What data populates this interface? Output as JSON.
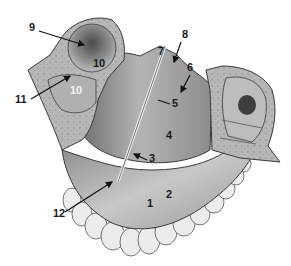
{
  "figure": {
    "colors": {
      "bone_light": "#d9d9d9",
      "bone_mid": "#a8a8a8",
      "bone_dark": "#6e6e6e",
      "cancellous": "#b9b9b9",
      "outline": "#3a3a3a",
      "teeth": "#ececec",
      "label": "#1a1a1a"
    }
  },
  "labels": [
    {
      "id": "1",
      "text": "1",
      "x": 151,
      "y": 203
    },
    {
      "id": "2",
      "text": "2",
      "x": 170,
      "y": 194
    },
    {
      "id": "3",
      "text": "3",
      "x": 148,
      "y": 157
    },
    {
      "id": "4",
      "text": "4",
      "x": 165,
      "y": 134
    },
    {
      "id": "5",
      "text": "5",
      "x": 172,
      "y": 103
    },
    {
      "id": "6",
      "text": "6",
      "x": 188,
      "y": 66
    },
    {
      "id": "7",
      "text": "7",
      "x": 158,
      "y": 49
    },
    {
      "id": "8",
      "text": "8",
      "x": 182,
      "y": 33
    },
    {
      "id": "9",
      "text": "9",
      "x": 29,
      "y": 26
    },
    {
      "id": "10a",
      "text": "10",
      "x": 94,
      "y": 61,
      "color": "dark"
    },
    {
      "id": "10b",
      "text": "10",
      "x": 71,
      "y": 88,
      "color": "white"
    },
    {
      "id": "11",
      "text": "11",
      "x": 16,
      "y": 98
    },
    {
      "id": "12",
      "text": "12",
      "x": 55,
      "y": 212
    }
  ]
}
